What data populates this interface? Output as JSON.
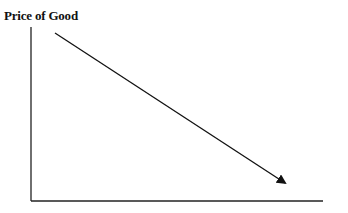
{
  "diagram": {
    "y_axis_label": "Price of Good",
    "x_axis_label": "",
    "axes": {
      "origin": [
        31,
        201
      ],
      "y_top": 27,
      "x_right": 323
    },
    "arrow": {
      "from": [
        55,
        33
      ],
      "to": [
        287,
        184
      ],
      "direction": "downward-sloping"
    },
    "line_color": "#111111"
  }
}
